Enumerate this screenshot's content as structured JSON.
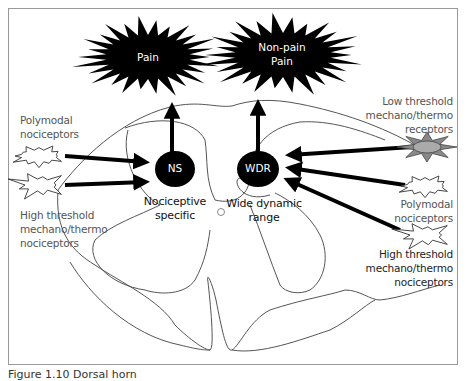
{
  "diagram": {
    "outputs": [
      {
        "id": "pain",
        "label": "Pain"
      },
      {
        "id": "non-pain-pain",
        "label_line1": "Non-pain",
        "label_line2": "Pain"
      }
    ],
    "neurons": [
      {
        "id": "ns",
        "abbr": "NS",
        "label_line1": "Nociceptive",
        "label_line2": "specific"
      },
      {
        "id": "wdr",
        "abbr": "WDR",
        "label_line1": "Wide dynamic",
        "label_line2": "range"
      }
    ],
    "left_receptors": [
      {
        "id": "polymodal-left",
        "label_line1": "Polymodal",
        "label_line2": "nociceptors",
        "targets": [
          "ns"
        ]
      },
      {
        "id": "high-threshold-left",
        "label_line1": "High threshold",
        "label_line2": "mechano/thermo",
        "label_line3": "nociceptors",
        "targets": [
          "ns"
        ]
      }
    ],
    "right_receptors": [
      {
        "id": "low-threshold-right",
        "label_line1": "Low threshold",
        "label_line2": "mechano/thermo",
        "label_line3": "receptors",
        "targets": [
          "wdr"
        ]
      },
      {
        "id": "polymodal-right",
        "label_line1": "Polymodal",
        "label_line2": "nociceptors",
        "targets": [
          "wdr"
        ]
      },
      {
        "id": "high-threshold-right",
        "label_line1": "High threshold",
        "label_line2": "mechano/thermo",
        "label_line3": "nociceptors",
        "targets": [
          "wdr"
        ]
      }
    ],
    "connections": [
      {
        "from": "ns",
        "to": "pain"
      },
      {
        "from": "wdr",
        "to": "non-pain-pain"
      }
    ],
    "colors": {
      "burst_fill": "#000000",
      "neuron_fill": "#000000",
      "arrow": "#000000",
      "cord_outline": "#555555",
      "low_threshold_fill": "#999999"
    }
  },
  "caption": "Figure 1.10  Dorsal horn"
}
